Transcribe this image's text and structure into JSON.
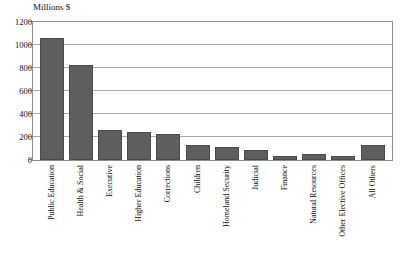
{
  "chart_data": {
    "type": "bar",
    "title": "Millions $",
    "xlabel": "",
    "ylabel": "Millions $",
    "ylim": [
      0,
      1200
    ],
    "yticks": [
      0,
      200,
      400,
      600,
      800,
      1000,
      1200
    ],
    "ytick_labels": [
      "0",
      "200",
      "400",
      "600",
      "800",
      "1000",
      "1200"
    ],
    "grid": true,
    "legend": null,
    "bar_color": "#5e5e5e",
    "categories": [
      "Public Education",
      "Health & Social",
      "Executive",
      "Higher Education",
      "Corrections",
      "Children",
      "Homeland Security",
      "Judicial",
      "Finance",
      "Natural Resources",
      "Other Elective Offices",
      "All Others"
    ],
    "values": [
      1060,
      825,
      265,
      240,
      230,
      130,
      115,
      90,
      35,
      50,
      35,
      130
    ],
    "bars": [
      {
        "label": "Public Education",
        "value": 1060
      },
      {
        "label": "Health & Social",
        "value": 825
      },
      {
        "label": "Executive",
        "value": 265
      },
      {
        "label": "Higher Education",
        "value": 240
      },
      {
        "label": "Corrections",
        "value": 230
      },
      {
        "label": "Children",
        "value": 130
      },
      {
        "label": "Homeland Security",
        "value": 115
      },
      {
        "label": "Judicial",
        "value": 90
      },
      {
        "label": "Finance",
        "value": 35
      },
      {
        "label": "Natural Resources",
        "value": 50
      },
      {
        "label": "Other Elective Offices",
        "value": 35
      },
      {
        "label": "All Others",
        "value": 130
      }
    ]
  }
}
